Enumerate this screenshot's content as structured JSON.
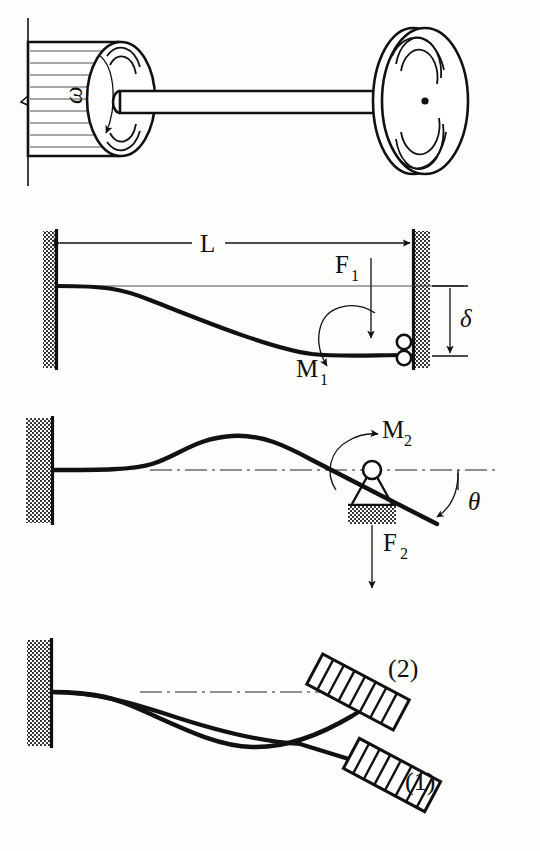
{
  "figure": {
    "background_color": "#fdfdfb",
    "ink_color": "#111111",
    "panels": [
      {
        "id": "panel-rotor",
        "name": "rotor-overhung-disk",
        "labels": [
          {
            "id": "omega",
            "text": "ω",
            "role": "angular-velocity-symbol",
            "rotated": true
          }
        ]
      },
      {
        "id": "panel-beam-f1-m1",
        "name": "cantilever-with-roller-guided-end",
        "labels": [
          {
            "id": "L",
            "text": "L",
            "role": "span-length-dimension"
          },
          {
            "id": "F1",
            "text": "F",
            "sub": "1",
            "role": "force-label"
          },
          {
            "id": "M1",
            "text": "M",
            "sub": "1",
            "role": "moment-label"
          },
          {
            "id": "delta",
            "text": "δ",
            "role": "deflection-dimension"
          }
        ]
      },
      {
        "id": "panel-beam-f2-m2",
        "name": "cantilever-with-pin-support",
        "labels": [
          {
            "id": "M2",
            "text": "M",
            "sub": "2",
            "role": "moment-label"
          },
          {
            "id": "F2",
            "text": "F",
            "sub": "2",
            "role": "force-label"
          },
          {
            "id": "theta",
            "text": "θ",
            "role": "slope-angle-label"
          }
        ]
      },
      {
        "id": "panel-mode-shapes",
        "name": "two-mode-shapes-with-disk",
        "labels": [
          {
            "id": "mode2",
            "text": "(2)",
            "role": "mode-number-label"
          },
          {
            "id": "mode1",
            "text": "(1)",
            "role": "mode-number-label"
          }
        ]
      }
    ]
  }
}
